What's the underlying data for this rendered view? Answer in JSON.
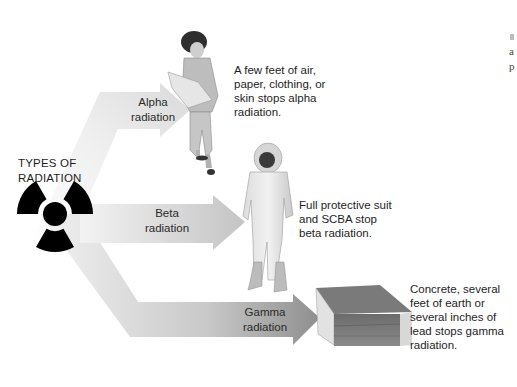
{
  "diagram": {
    "title": "TYPES OF RADIATION",
    "title_lines": [
      "TYPES OF",
      "RADIATION"
    ],
    "symbol": "radiation-trefoil-icon",
    "colors": {
      "arrow_light": "#eeeeee",
      "arrow_dark": "#9a9a9a",
      "symbol": "#000000",
      "text": "#1e1e1e"
    },
    "arrows": [
      {
        "id": "alpha",
        "label_lines": [
          "Alpha",
          "radiation"
        ],
        "target": "person in ordinary clothes reading paper",
        "description_lines": [
          "A few feet of air,",
          "paper, clothing, or",
          "skin stops alpha",
          "radiation."
        ]
      },
      {
        "id": "beta",
        "label_lines": [
          "Beta",
          "radiation"
        ],
        "target": "person in full protective suit with SCBA",
        "description_lines": [
          "Full protective suit",
          "and SCBA stop",
          "beta radiation."
        ]
      },
      {
        "id": "gamma",
        "label_lines": [
          "Gamma",
          "radiation"
        ],
        "target": "cross-section block of concrete/earth/lead",
        "description_lines": [
          "Concrete, several",
          "feet of earth or",
          "several inches of",
          "lead stops gamma",
          "radiation."
        ]
      }
    ],
    "edge_fragments": [
      "a",
      "p"
    ]
  }
}
